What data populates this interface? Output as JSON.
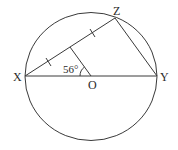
{
  "diagram": {
    "type": "circle-geometry",
    "circle": {
      "center": "O",
      "cx": 91,
      "cy": 76.5,
      "rx": 66,
      "ry": 64
    },
    "points": {
      "X": {
        "label": "X",
        "x": 25,
        "y": 76
      },
      "Y": {
        "label": "Y",
        "x": 157,
        "y": 76
      },
      "Z": {
        "label": "Z",
        "x": 115,
        "y": 18
      },
      "O": {
        "label": "O",
        "x": 91,
        "y": 76
      }
    },
    "segments": [
      "XY",
      "XZ",
      "ZY",
      "O-to-midpoint-of-XZ"
    ],
    "angle": {
      "label": "56°",
      "at": "O",
      "between": [
        "OX",
        "O-midpoint"
      ]
    },
    "tick_marks": "XZ bisected (equal halves marked)",
    "labels": {
      "X": "X",
      "Y": "Y",
      "Z": "Z",
      "O": "O",
      "angle": "56°"
    }
  }
}
